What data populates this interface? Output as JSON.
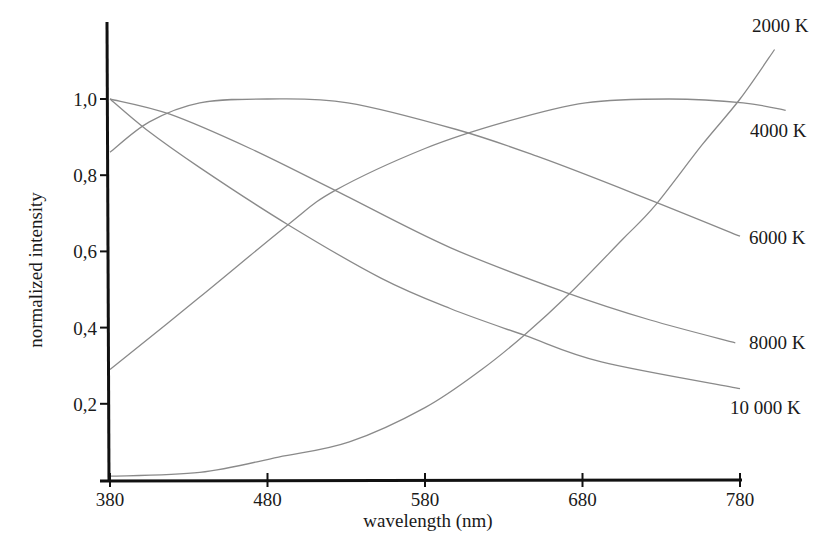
{
  "chart_data": {
    "type": "line",
    "title": "",
    "xlabel": "wavelength (nm)",
    "ylabel": "normalized intensity",
    "xlim": [
      380,
      780
    ],
    "ylim": [
      0,
      1.0
    ],
    "grid": false,
    "legend_position": "inline-right",
    "x_ticks": [
      380,
      480,
      580,
      680,
      780
    ],
    "x_tick_labels": [
      "380",
      "480",
      "580",
      "680",
      "780"
    ],
    "y_ticks": [
      0.2,
      0.4,
      0.6,
      0.8,
      1.0
    ],
    "y_tick_labels": [
      "0,2",
      "0,4",
      "0,6",
      "0,8",
      "1,0"
    ],
    "series": [
      {
        "name": "2000 K",
        "label": "2000 K",
        "points": [
          [
            380,
            0.01
          ],
          [
            437,
            0.02
          ],
          [
            487,
            0.06
          ],
          [
            532,
            0.1
          ],
          [
            580,
            0.19
          ],
          [
            616,
            0.29
          ],
          [
            643,
            0.38
          ],
          [
            672,
            0.49
          ],
          [
            705,
            0.63
          ],
          [
            726,
            0.72
          ],
          [
            756,
            0.88
          ],
          [
            780,
            1.0
          ],
          [
            802,
            1.13
          ]
        ]
      },
      {
        "name": "4000 K",
        "label": "4000 K",
        "points": [
          [
            380,
            0.29
          ],
          [
            437,
            0.48
          ],
          [
            493,
            0.67
          ],
          [
            523,
            0.76
          ],
          [
            580,
            0.87
          ],
          [
            631,
            0.94
          ],
          [
            682,
            0.99
          ],
          [
            735,
            1.0
          ],
          [
            782,
            0.99
          ],
          [
            809,
            0.97
          ]
        ]
      },
      {
        "name": "6000 K",
        "label": "6000 K",
        "points": [
          [
            380,
            0.86
          ],
          [
            405,
            0.94
          ],
          [
            437,
            0.99
          ],
          [
            480,
            1.0
          ],
          [
            531,
            0.99
          ],
          [
            600,
            0.92
          ],
          [
            651,
            0.85
          ],
          [
            714,
            0.75
          ],
          [
            780,
            0.64
          ]
        ]
      },
      {
        "name": "8000 K",
        "label": "8000 K",
        "points": [
          [
            380,
            1.0
          ],
          [
            418,
            0.96
          ],
          [
            469,
            0.87
          ],
          [
            523,
            0.76
          ],
          [
            596,
            0.61
          ],
          [
            671,
            0.49
          ],
          [
            723,
            0.42
          ],
          [
            777,
            0.36
          ]
        ]
      },
      {
        "name": "10 000 K",
        "label": "10 000 K",
        "points": [
          [
            380,
            1.0
          ],
          [
            403,
            0.92
          ],
          [
            437,
            0.82
          ],
          [
            493,
            0.67
          ],
          [
            552,
            0.53
          ],
          [
            596,
            0.45
          ],
          [
            643,
            0.38
          ],
          [
            692,
            0.31
          ],
          [
            780,
            0.24
          ]
        ]
      }
    ],
    "label_positions": [
      {
        "series": "2000 K",
        "x": 752,
        "y": 32
      },
      {
        "series": "4000 K",
        "x": 750,
        "y": 137
      },
      {
        "series": "6000 K",
        "x": 749,
        "y": 244
      },
      {
        "series": "8000 K",
        "x": 749,
        "y": 349
      },
      {
        "series": "10 000 K",
        "x": 730,
        "y": 414
      }
    ],
    "colors": {
      "curve": "#8a8a8a",
      "axis": "#111111",
      "text": "#1a1a1a"
    }
  }
}
